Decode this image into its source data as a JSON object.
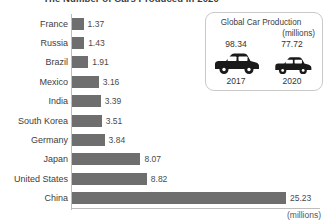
{
  "chart_data": {
    "type": "bar",
    "title": "The Number of Cars Produced in 2020",
    "orientation": "horizontal",
    "xlabel": "(millions)",
    "ylabel": "",
    "xlim": [
      0,
      25.23
    ],
    "grid": false,
    "legend": "none",
    "bar_color": "#6e6e6e",
    "categories": [
      "France",
      "Russia",
      "Brazil",
      "Mexico",
      "India",
      "South Korea",
      "Germany",
      "Japan",
      "United States",
      "China"
    ],
    "values": [
      1.37,
      1.43,
      1.91,
      3.16,
      3.39,
      3.51,
      3.84,
      8.07,
      8.82,
      25.23
    ],
    "value_labels": [
      "1.37",
      "1.43",
      "1.91",
      "3.16",
      "3.39",
      "3.51",
      "3.84",
      "8.07",
      "8.82",
      "25.23"
    ],
    "annotations": [
      "(millions)"
    ]
  },
  "rows": [
    {
      "label": "France",
      "value": 1.37,
      "value_label": "1.37"
    },
    {
      "label": "Russia",
      "value": 1.43,
      "value_label": "1.43"
    },
    {
      "label": "Brazil",
      "value": 1.91,
      "value_label": "1.91"
    },
    {
      "label": "Mexico",
      "value": 3.16,
      "value_label": "3.16"
    },
    {
      "label": "India",
      "value": 3.39,
      "value_label": "3.39"
    },
    {
      "label": "South Korea",
      "value": 3.51,
      "value_label": "3.51"
    },
    {
      "label": "Germany",
      "value": 3.84,
      "value_label": "3.84"
    },
    {
      "label": "Japan",
      "value": 8.07,
      "value_label": "8.07"
    },
    {
      "label": "United States",
      "value": 8.82,
      "value_label": "8.82"
    },
    {
      "label": "China",
      "value": 25.23,
      "value_label": "25.23"
    }
  ],
  "axis": {
    "unit_label": "(millions)"
  },
  "inset": {
    "title": "Global Car Production",
    "subtitle": "(millions)",
    "items": [
      {
        "value": "98.34",
        "year": "2017",
        "icon": "car-icon",
        "size": "large"
      },
      {
        "value": "77.72",
        "year": "2020",
        "icon": "car-icon",
        "size": "small"
      }
    ]
  }
}
